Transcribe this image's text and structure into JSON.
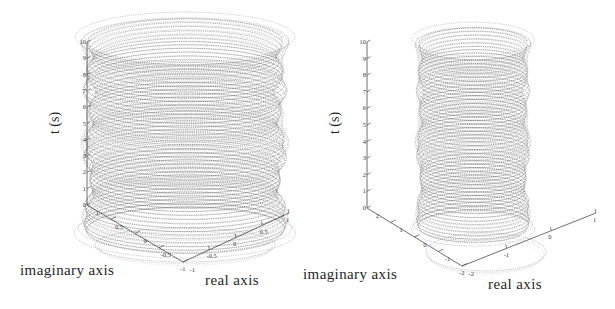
{
  "figure": {
    "background_color": "#ffffff",
    "ink_color": "#333333",
    "panel_count": 2,
    "layout": "two 3D trajectory plots side by side"
  },
  "chart_data": [
    {
      "id": "left-panel",
      "type": "line",
      "title": "",
      "subtitle": "",
      "projection": "3d",
      "description": "Dense helical trajectory of a complex-valued signal plotted against time; tightly wound spiral forming a near-cylindrical envelope of radius about 1, with a projected ring traced on the base plane.",
      "xlabel": "real axis",
      "ylabel": "imaginary axis",
      "zlabel": "t (s)",
      "xlim": [
        -1,
        1
      ],
      "ylim": [
        -1,
        1
      ],
      "zlim": [
        0,
        10
      ],
      "xticks": [
        "-1",
        "-0.5",
        "0",
        "0.5",
        "1"
      ],
      "yticks": [
        "1",
        "0.5",
        "0",
        "-0.5",
        "-1"
      ],
      "zticks": [
        "0",
        "1",
        "2",
        "3",
        "4",
        "5",
        "6",
        "7",
        "8",
        "9",
        "10"
      ],
      "grid": false,
      "legend": "none",
      "envelope_radius": 1.0,
      "turns": 52,
      "base_projection": true,
      "series": [
        {
          "name": "complex trajectory",
          "color": "#333333",
          "style": "dotted-line",
          "radius": 1.0,
          "t_start": 0,
          "t_end": 10
        }
      ]
    },
    {
      "id": "right-panel",
      "type": "line",
      "title": "",
      "subtitle": "",
      "projection": "3d",
      "description": "Dense helical trajectory over a wider complex plane; narrower cylindrical envelope of radius about 1 inside a plane spanning -2 to 2, with a large elliptical projection on the base plane.",
      "xlabel": "real axis",
      "ylabel": "imaginary axis",
      "zlabel": "t (s)",
      "xlim": [
        -2,
        1
      ],
      "ylim": [
        -2,
        2
      ],
      "zlim": [
        0,
        10
      ],
      "xticks": [
        "-2",
        "-1",
        "0",
        "1"
      ],
      "yticks": [
        "2",
        "1",
        "0",
        "-1",
        "-2"
      ],
      "zticks": [
        "0",
        "1",
        "2",
        "3",
        "4",
        "5",
        "6",
        "7",
        "8",
        "9",
        "10"
      ],
      "grid": false,
      "legend": "none",
      "envelope_radius": 1.0,
      "turns": 52,
      "base_projection": true,
      "series": [
        {
          "name": "complex trajectory",
          "color": "#333333",
          "style": "dotted-line",
          "radius": 1.0,
          "t_start": 0,
          "t_end": 10
        }
      ]
    }
  ],
  "left": {
    "axis_labels": {
      "imaginary": "imaginary axis",
      "real": "real axis",
      "time": "t (s)"
    },
    "z_ticks": [
      "10",
      "9",
      "8",
      "7",
      "6",
      "5",
      "4",
      "3",
      "2",
      "1",
      "0"
    ],
    "imag_ticks": [
      "1",
      "0.5",
      "0",
      "-0.5",
      "-1"
    ],
    "real_ticks": [
      "-1",
      "-0.5",
      "0",
      "0.5",
      "1"
    ]
  },
  "right": {
    "axis_labels": {
      "imaginary": "imaginary axis",
      "real": "real axis",
      "time": "t (s)"
    },
    "z_ticks": [
      "10",
      "9",
      "8",
      "7",
      "6",
      "5",
      "4",
      "3",
      "2",
      "1",
      "0"
    ],
    "imag_ticks": [
      "2",
      "1",
      "0",
      "-1",
      "-2"
    ],
    "real_ticks": [
      "-2",
      "-1",
      "0",
      "1"
    ]
  }
}
